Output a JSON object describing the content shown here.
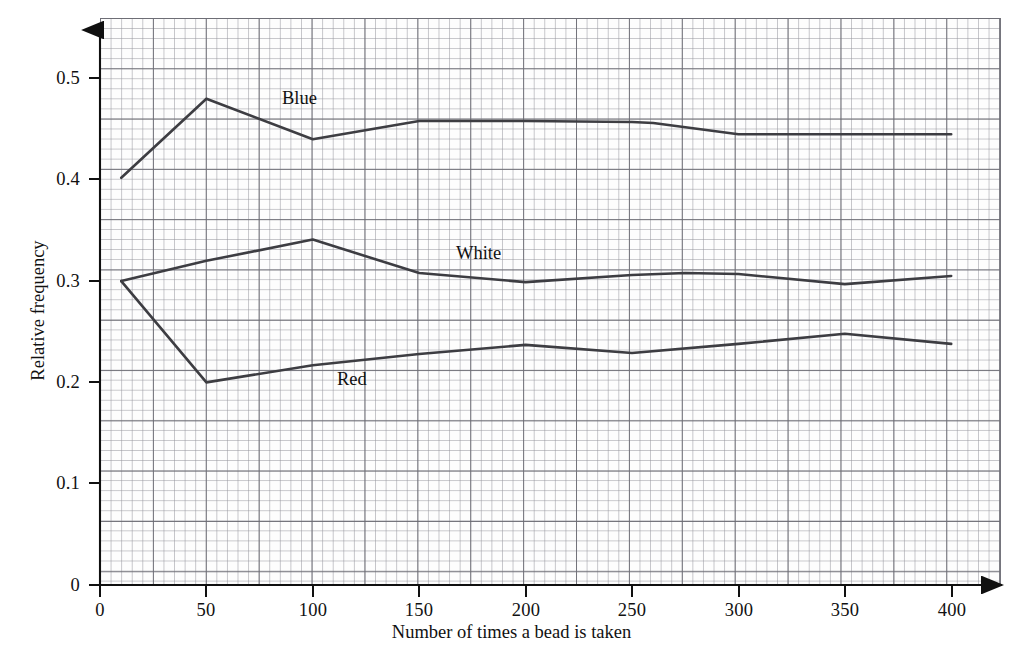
{
  "chart_data": {
    "type": "line",
    "title": "",
    "xlabel": "Number of times a bead is taken",
    "ylabel": "Relative frequency",
    "xlim": [
      0,
      425
    ],
    "ylim": [
      0,
      0.555
    ],
    "xticks": [
      "0",
      "50",
      "100",
      "150",
      "200",
      "250",
      "300",
      "350",
      "400"
    ],
    "xtick_values": [
      0,
      50,
      100,
      150,
      200,
      250,
      300,
      350,
      400
    ],
    "yticks": [
      "0",
      "0.1",
      "0.2",
      "0.3",
      "0.4",
      "0.5"
    ],
    "ytick_values": [
      0,
      0.1,
      0.2,
      0.3,
      0.4,
      0.5
    ],
    "grid": true,
    "grid_style": "graph-paper",
    "legend": "inline-labels",
    "series": [
      {
        "name": "Blue",
        "label": "Blue",
        "color": "#3d3d42",
        "label_x": 282,
        "label_y": 88,
        "x": [
          10,
          50,
          100,
          150,
          200,
          250,
          260,
          300,
          350,
          400
        ],
        "values": [
          0.402,
          0.48,
          0.44,
          0.458,
          0.458,
          0.457,
          0.456,
          0.445,
          0.445,
          0.445
        ]
      },
      {
        "name": "White",
        "label": "White",
        "color": "#3d3d42",
        "label_x": 456,
        "label_y": 243,
        "x": [
          10,
          50,
          100,
          150,
          200,
          250,
          275,
          300,
          350,
          400
        ],
        "values": [
          0.3,
          0.32,
          0.341,
          0.308,
          0.299,
          0.306,
          0.308,
          0.307,
          0.297,
          0.305
        ]
      },
      {
        "name": "Red",
        "label": "Red",
        "color": "#3d3d42",
        "label_x": 337,
        "label_y": 369,
        "x": [
          10,
          50,
          100,
          150,
          200,
          250,
          300,
          350,
          400
        ],
        "values": [
          0.3,
          0.2,
          0.217,
          0.228,
          0.237,
          0.229,
          0.238,
          0.248,
          0.238
        ]
      }
    ]
  },
  "axes": {
    "x_origin_px": 100,
    "y_origin_px": 585,
    "x_scale_px_per_unit": 2.128,
    "y_scale_px_per_unit": 1013.0
  }
}
